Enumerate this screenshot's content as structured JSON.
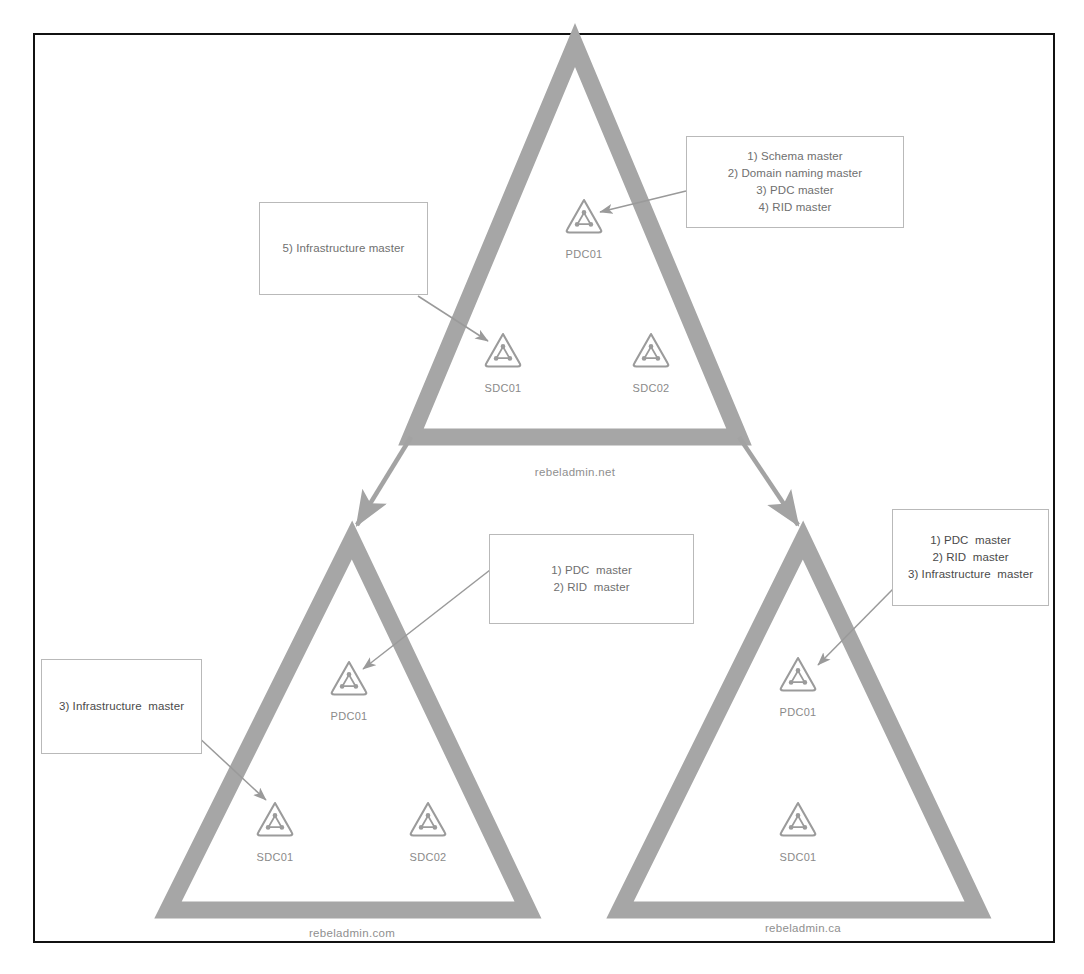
{
  "diagram": {
    "frame_border_color": "#111111",
    "triangle_color": "#a6a6a6",
    "label_color": "#8a8a8a",
    "callout_border_color": "#b9b9b9"
  },
  "domains": [
    {
      "id": "root",
      "name": "rebeladmin.net",
      "nodes": [
        {
          "id": "root-pdc01",
          "label": "PDC01",
          "icon": "domain-controller-icon"
        },
        {
          "id": "root-sdc01",
          "label": "SDC01",
          "icon": "domain-controller-icon"
        },
        {
          "id": "root-sdc02",
          "label": "SDC02",
          "icon": "domain-controller-icon"
        }
      ]
    },
    {
      "id": "child-com",
      "name": "rebeladmin.com",
      "nodes": [
        {
          "id": "com-pdc01",
          "label": "PDC01",
          "icon": "domain-controller-icon"
        },
        {
          "id": "com-sdc01",
          "label": "SDC01",
          "icon": "domain-controller-icon"
        },
        {
          "id": "com-sdc02",
          "label": "SDC02",
          "icon": "domain-controller-icon"
        }
      ]
    },
    {
      "id": "child-ca",
      "name": "rebeladmin.ca",
      "nodes": [
        {
          "id": "ca-pdc01",
          "label": "PDC01",
          "icon": "domain-controller-icon"
        },
        {
          "id": "ca-sdc01",
          "label": "SDC01",
          "icon": "domain-controller-icon"
        }
      ]
    }
  ],
  "callouts": [
    {
      "id": "callout-root-pdc",
      "target": "root-pdc01",
      "text": "1) Schema master\n2) Domain naming master\n3) PDC master\n4) RID master",
      "roles": [
        "1) Schema master",
        "2) Domain naming master",
        "3) PDC master",
        "4) RID master"
      ]
    },
    {
      "id": "callout-root-sdc01",
      "target": "root-sdc01",
      "text": "5) Infrastructure master",
      "roles": [
        "5) Infrastructure master"
      ]
    },
    {
      "id": "callout-com-pdc",
      "target": "com-pdc01",
      "text": "1) PDC  master\n2) RID  master",
      "roles": [
        "1) PDC  master",
        "2) RID  master"
      ]
    },
    {
      "id": "callout-com-sdc01",
      "target": "com-sdc01",
      "text": "3) Infrastructure  master",
      "roles": [
        "3) Infrastructure  master"
      ]
    },
    {
      "id": "callout-ca-pdc",
      "target": "ca-pdc01",
      "text": "1) PDC  master\n2) RID  master\n3) Infrastructure  master",
      "roles": [
        "1) PDC  master",
        "2) RID  master",
        "3) Infrastructure  master"
      ]
    }
  ],
  "trusts": [
    {
      "id": "trust-root-to-com",
      "from": "rebeladmin.net",
      "to": "rebeladmin.com"
    },
    {
      "id": "trust-root-to-ca",
      "from": "rebeladmin.net",
      "to": "rebeladmin.ca"
    }
  ]
}
